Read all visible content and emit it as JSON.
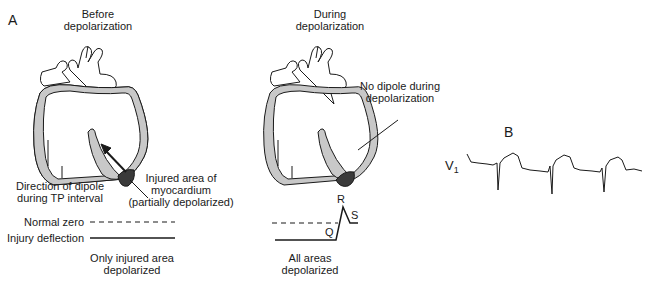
{
  "panels": {
    "A": "A",
    "B": "B"
  },
  "heart_left": {
    "title_line1": "Before",
    "title_line2": "depolarization",
    "dipole_label_line1": "Direction of dipole",
    "dipole_label_line2": "during TP interval",
    "injury_label_line1": "Injured area of",
    "injury_label_line2": "myocardium",
    "injury_label_line3": "(partially depolarized)",
    "normal_zero": "Normal zero",
    "injury_deflection": "Injury deflection",
    "caption_line1": "Only injured area",
    "caption_line2": "depolarized"
  },
  "heart_right": {
    "title_line1": "During",
    "title_line2": "depolarization",
    "no_dipole_line1": "No dipole during",
    "no_dipole_line2": "depolarization",
    "wave_R": "R",
    "wave_S": "S",
    "wave_Q": "Q",
    "caption_line1": "All areas",
    "caption_line2": "depolarized"
  },
  "ecg": {
    "lead": "V",
    "lead_sub": "1"
  },
  "colors": {
    "line": "#1a1a1a",
    "myocardium": "#c8c8c8",
    "injured": "#3a3a3a"
  }
}
